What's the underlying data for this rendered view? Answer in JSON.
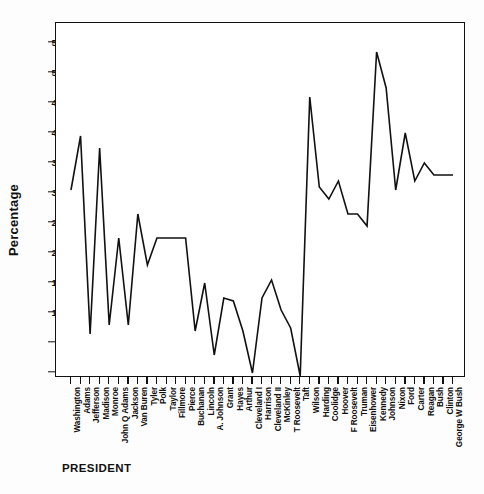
{
  "chart_data": {
    "type": "line",
    "title": "",
    "xlabel": "PRESIDENT",
    "ylabel": "Percentage",
    "ylim": [
      -2,
      58
    ],
    "yticks": [
      0,
      5,
      10,
      15,
      20,
      25,
      30,
      35,
      40,
      45,
      50,
      55
    ],
    "grid": false,
    "legend": null,
    "line_color": "#111111",
    "categories": [
      "Washington",
      "Adams",
      "Jefferson",
      "Madison",
      "Monroe",
      "John Q Adams",
      "Jackson",
      "Van Buren",
      "Tyler",
      "Polk",
      "Taylor",
      "Fillmore",
      "Pierce",
      "Buchanan",
      "Lincoln",
      "A. Johnson",
      "Grant",
      "Hayes",
      "Arthur",
      "Cleveland I",
      "Harrison",
      "Cleveland II",
      "McKinley",
      "T Roosevelt",
      "Taft",
      "Wilson",
      "Harding",
      "Coolidge",
      "Hoover",
      "F Roosevelt",
      "Truman",
      "Eisenhower",
      "Kennedy",
      "Johnson",
      "Nixon",
      "Ford",
      "Carter",
      "Reagan",
      "Bush",
      "Clinton",
      "George W Bush"
    ],
    "values": [
      30.5,
      39.5,
      6.5,
      37.5,
      8.0,
      22.5,
      8.0,
      26.5,
      18.0,
      22.5,
      22.5,
      22.5,
      22.5,
      7.0,
      15.0,
      3.0,
      12.5,
      12.0,
      7.0,
      0.0,
      12.5,
      15.5,
      10.5,
      7.5,
      -0.5,
      46.0,
      31.0,
      29.0,
      32.0,
      26.5,
      26.5,
      24.5,
      53.5,
      47.5,
      30.5,
      40.0,
      32.0,
      35.0,
      33.0,
      33.0,
      33.0
    ],
    "series": [
      {
        "name": "Percentage",
        "values": [
          30.5,
          39.5,
          6.5,
          37.5,
          8.0,
          22.5,
          8.0,
          26.5,
          18.0,
          22.5,
          22.5,
          22.5,
          22.5,
          7.0,
          15.0,
          3.0,
          12.5,
          12.0,
          7.0,
          0.0,
          12.5,
          15.5,
          10.5,
          7.5,
          -0.5,
          46.0,
          31.0,
          29.0,
          32.0,
          26.5,
          26.5,
          24.5,
          53.5,
          47.5,
          30.5,
          40.0,
          32.0,
          35.0,
          33.0,
          33.0,
          33.0
        ]
      }
    ]
  },
  "axis": {
    "y_title": "Percentage",
    "x_title": "PRESIDENT"
  }
}
